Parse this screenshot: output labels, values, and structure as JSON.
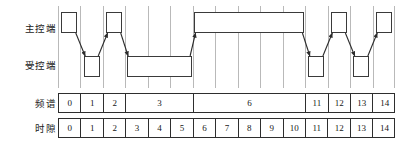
{
  "labels": {
    "master": "主控端",
    "slave": "受控端",
    "spectrum": "频谱",
    "timeslot": "时隙"
  },
  "colors": {
    "block_border": "#3a3a3a",
    "gridline": "#b9b9b9",
    "table_border": "#2e2e2e",
    "arrow": "#2b2b2b",
    "background": "#ffffff",
    "text": "#171717"
  },
  "chart_data": {
    "type": "table",
    "title": "",
    "xlabel": "时隙",
    "ylabel": "",
    "slot_count": 15,
    "rows": [
      {
        "name": "主控端",
        "blocks": [
          {
            "start": 0,
            "span": 1,
            "label": ""
          },
          {
            "start": 2,
            "span": 1,
            "label": ""
          },
          {
            "start": 6,
            "span": 5,
            "label": ""
          },
          {
            "start": 12,
            "span": 1,
            "label": ""
          },
          {
            "start": 14,
            "span": 1,
            "label": ""
          }
        ]
      },
      {
        "name": "受控端",
        "blocks": [
          {
            "start": 1,
            "span": 1,
            "label": ""
          },
          {
            "start": 3,
            "span": 3,
            "label": ""
          },
          {
            "start": 11,
            "span": 1,
            "label": ""
          },
          {
            "start": 13,
            "span": 1,
            "label": ""
          }
        ]
      }
    ],
    "transitions": [
      {
        "from_row": "主控端",
        "from_slot": 0,
        "to_row": "受控端",
        "to_slot": 1
      },
      {
        "from_row": "受控端",
        "from_slot": 1,
        "to_row": "主控端",
        "to_slot": 2
      },
      {
        "from_row": "主控端",
        "from_slot": 2,
        "to_row": "受控端",
        "to_slot": 3
      },
      {
        "from_row": "受控端",
        "from_slot": 5,
        "to_row": "主控端",
        "to_slot": 6
      },
      {
        "from_row": "主控端",
        "from_slot": 10,
        "to_row": "受控端",
        "to_slot": 11
      },
      {
        "from_row": "受控端",
        "from_slot": 11,
        "to_row": "主控端",
        "to_slot": 12
      },
      {
        "from_row": "主控端",
        "from_slot": 12,
        "to_row": "受控端",
        "to_slot": 13
      },
      {
        "from_row": "受控端",
        "from_slot": 13,
        "to_row": "主控端",
        "to_slot": 14
      }
    ],
    "spectrum_row": {
      "label": "频谱",
      "cells": [
        {
          "value": "0",
          "span": 1
        },
        {
          "value": "1",
          "span": 1
        },
        {
          "value": "2",
          "span": 1
        },
        {
          "value": "3",
          "span": 3
        },
        {
          "value": "6",
          "span": 5
        },
        {
          "value": "11",
          "span": 1
        },
        {
          "value": "12",
          "span": 1
        },
        {
          "value": "13",
          "span": 1
        },
        {
          "value": "14",
          "span": 1
        }
      ]
    },
    "timeslot_row": {
      "label": "时隙",
      "cells": [
        {
          "value": "0",
          "span": 1
        },
        {
          "value": "1",
          "span": 1
        },
        {
          "value": "2",
          "span": 1
        },
        {
          "value": "3",
          "span": 1
        },
        {
          "value": "4",
          "span": 1
        },
        {
          "value": "5",
          "span": 1
        },
        {
          "value": "6",
          "span": 1
        },
        {
          "value": "7",
          "span": 1
        },
        {
          "value": "8",
          "span": 1
        },
        {
          "value": "9",
          "span": 1
        },
        {
          "value": "10",
          "span": 1
        },
        {
          "value": "11",
          "span": 1
        },
        {
          "value": "12",
          "span": 1
        },
        {
          "value": "13",
          "span": 1
        },
        {
          "value": "14",
          "span": 1
        }
      ]
    }
  }
}
